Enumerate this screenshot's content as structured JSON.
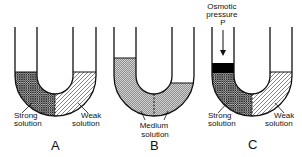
{
  "figure": {
    "colors": {
      "line": "#111111",
      "background": "#ffffff",
      "strong_fill": "#3a3a3a",
      "weak_fill": "#9a9a9a",
      "medium_fill": "#7a7a7a",
      "piston": "#000000"
    },
    "panels": [
      {
        "letter": "A",
        "labels": {
          "left": [
            "Strong",
            "solution"
          ],
          "right": [
            "Weak",
            "solution"
          ]
        }
      },
      {
        "letter": "B",
        "labels": {
          "center": [
            "Medium",
            "solution"
          ]
        }
      },
      {
        "letter": "C",
        "annotation": [
          "Osmotic",
          "pressure",
          "P"
        ],
        "labels": {
          "left": [
            "Strong",
            "solution"
          ],
          "right": [
            "Weak",
            "solution"
          ]
        }
      }
    ]
  }
}
